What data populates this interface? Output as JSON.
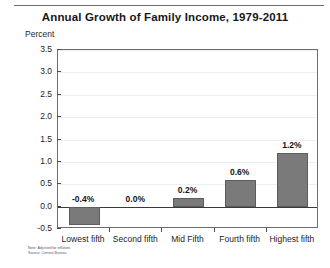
{
  "chart_data": {
    "type": "bar",
    "title": "Annual Growth of Family Income, 1979-2011",
    "ylabel": "Percent",
    "xlabel": "",
    "categories": [
      "Lowest fifth",
      "Second fifth",
      "Mid Fifth",
      "Fourth fifth",
      "Highest fifth"
    ],
    "values": [
      -0.4,
      0.0,
      0.2,
      0.6,
      1.2
    ],
    "data_labels": [
      "-0.4%",
      "0.0%",
      "0.2%",
      "0.6%",
      "1.2%"
    ],
    "ylim": [
      -0.5,
      3.5
    ],
    "ytick_labels": [
      "3.5",
      "3.0",
      "2.5",
      "2.0",
      "1.5",
      "1.0",
      "0.5",
      "0.0",
      "-0.5"
    ],
    "ytick_values": [
      3.5,
      3.0,
      2.5,
      2.0,
      1.5,
      1.0,
      0.5,
      0.0,
      -0.5
    ],
    "grid": true,
    "legend": "none",
    "bar_color": "#7a7a7a",
    "bar_border_color": "#5d5d5d",
    "gridline_color": "#eeeeee",
    "axis_color": "#6e6e6e",
    "zero_line_color": "#3a3a3a",
    "background": "#ffffff"
  },
  "notes": {
    "line1": "Note: Adjusted for inflation.",
    "line2": "Source: Census Bureau."
  }
}
